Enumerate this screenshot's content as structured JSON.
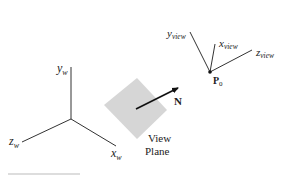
{
  "diagram": {
    "world_frame": {
      "y_axis": {
        "base": "y",
        "sub": "w"
      },
      "x_axis": {
        "base": "x",
        "sub": "w"
      },
      "z_axis": {
        "base": "z",
        "sub": "w"
      }
    },
    "view_frame": {
      "y_axis": {
        "base": "y",
        "sub": "view"
      },
      "x_axis": {
        "base": "x",
        "sub": "view"
      },
      "z_axis": {
        "base": "z",
        "sub": "view"
      },
      "origin": {
        "base": "P",
        "sub": "0"
      }
    },
    "normal_vector": {
      "label": "N"
    },
    "view_plane": {
      "line1": "View",
      "line2": "Plane"
    }
  },
  "colors": {
    "line": "#333333",
    "plane_fill": "#d6d6d6",
    "text": "#222222"
  }
}
